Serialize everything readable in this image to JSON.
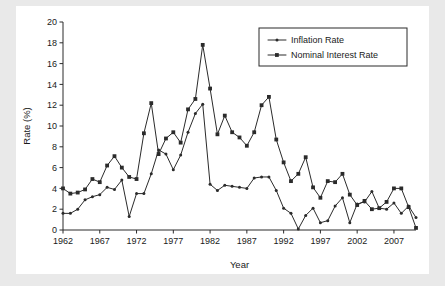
{
  "figure": {
    "panel_background": "#ffffff",
    "outer_background": "#e9e9e9",
    "ink_color": "#2b2b2b"
  },
  "axis": {
    "y_title": "Rate (%)",
    "x_title": "Year",
    "y_ticks": [
      "0",
      "2",
      "4",
      "6",
      "8",
      "10",
      "12",
      "14",
      "16",
      "18",
      "20"
    ],
    "x_ticks": [
      "1962",
      "1967",
      "1972",
      "1977",
      "1982",
      "1987",
      "1992",
      "1997",
      "2002",
      "2007"
    ]
  },
  "legend": {
    "position": "top-right",
    "entries": [
      {
        "label": "Inflation Rate",
        "marker": "diamond-marker"
      },
      {
        "label": "Nominal Interest Rate",
        "marker": "square-marker"
      }
    ]
  },
  "chart_data": {
    "type": "line",
    "title": "",
    "subtitle": "",
    "xlabel": "Year",
    "ylabel": "Rate (%)",
    "xlim": [
      1962,
      2010
    ],
    "ylim": [
      0,
      20
    ],
    "ytick_step": 2,
    "xtick_step": 5,
    "grid": false,
    "legend_position": "top-right",
    "x": [
      1962,
      1963,
      1964,
      1965,
      1966,
      1967,
      1968,
      1969,
      1970,
      1971,
      1972,
      1973,
      1974,
      1975,
      1976,
      1977,
      1978,
      1979,
      1980,
      1981,
      1982,
      1983,
      1984,
      1985,
      1986,
      1987,
      1988,
      1989,
      1990,
      1991,
      1992,
      1993,
      1994,
      1995,
      1996,
      1997,
      1998,
      1999,
      2000,
      2001,
      2002,
      2003,
      2004,
      2005,
      2006,
      2007,
      2008,
      2009,
      2010
    ],
    "series": [
      {
        "name": "Inflation Rate",
        "marker": "diamond-marker",
        "values": [
          1.6,
          1.6,
          2.0,
          2.9,
          3.2,
          3.4,
          4.1,
          3.9,
          4.8,
          1.3,
          3.5,
          3.5,
          5.4,
          7.7,
          7.3,
          5.8,
          7.2,
          9.4,
          11.2,
          12.1,
          4.4,
          3.8,
          4.3,
          4.2,
          4.1,
          4.0,
          5.0,
          5.1,
          5.1,
          3.8,
          2.1,
          1.6,
          0.1,
          1.4,
          2.1,
          0.7,
          0.9,
          2.3,
          3.1,
          0.7,
          2.5,
          2.7,
          3.7,
          2.1,
          2.0,
          2.6,
          1.6,
          2.3,
          1.2
        ]
      },
      {
        "name": "Nominal Interest Rate",
        "marker": "square-marker",
        "values": [
          4.0,
          3.5,
          3.6,
          3.9,
          4.9,
          4.6,
          6.2,
          7.1,
          6.0,
          5.1,
          4.9,
          9.3,
          12.2,
          7.3,
          8.8,
          9.4,
          8.4,
          11.6,
          12.6,
          17.8,
          13.6,
          9.2,
          11.0,
          9.4,
          8.9,
          8.1,
          9.4,
          12.0,
          12.8,
          8.7,
          6.5,
          4.7,
          5.4,
          7.0,
          4.1,
          3.1,
          4.7,
          4.6,
          5.4,
          3.4,
          2.4,
          2.8,
          2.0,
          2.1,
          2.7,
          4.0,
          4.0,
          2.2,
          0.2
        ]
      }
    ]
  }
}
